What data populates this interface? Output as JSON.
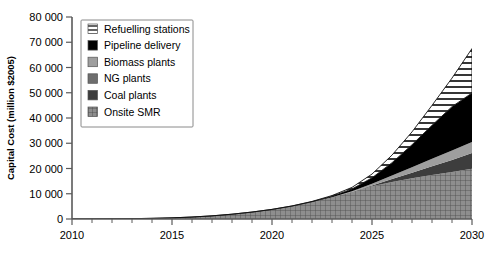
{
  "chart_data": {
    "type": "area",
    "stacked": true,
    "title": "",
    "xlabel": "",
    "ylabel": "Capital Cost (million $2005)",
    "xlim": [
      2010,
      2030
    ],
    "ylim": [
      0,
      80000
    ],
    "grid": false,
    "legend_position": "upper-left-inside",
    "xticks": [
      "2010",
      "2015",
      "2020",
      "2025",
      "2030"
    ],
    "xtick_values": [
      2010,
      2015,
      2020,
      2025,
      2030
    ],
    "xminor_step": 1,
    "yticks": [
      "0",
      "10 000",
      "20 000",
      "30 000",
      "40 000",
      "50 000",
      "60 000",
      "70 000",
      "80 000"
    ],
    "ytick_values": [
      0,
      10000,
      20000,
      30000,
      40000,
      50000,
      60000,
      70000,
      80000
    ],
    "x": [
      2010,
      2011,
      2012,
      2013,
      2014,
      2015,
      2016,
      2017,
      2018,
      2019,
      2020,
      2021,
      2022,
      2023,
      2024,
      2025,
      2026,
      2027,
      2028,
      2029,
      2030
    ],
    "series": [
      {
        "name": "Onsite SMR",
        "fill": "crosshatch-gray",
        "color": "#8c8c8c",
        "values": [
          0,
          20,
          60,
          130,
          260,
          450,
          780,
          1250,
          1900,
          2750,
          3800,
          5100,
          6700,
          8600,
          10800,
          13000,
          14700,
          16100,
          17400,
          18600,
          19900
        ]
      },
      {
        "name": "Coal plants",
        "fill": "solid-dark-gray",
        "color": "#3d3d3d",
        "values": [
          0,
          0,
          0,
          0,
          0,
          0,
          0,
          0,
          0,
          0,
          0,
          0,
          0,
          0,
          0,
          300,
          1100,
          2200,
          3500,
          4800,
          6200
        ]
      },
      {
        "name": "NG plants",
        "fill": "solid-mid-gray",
        "color": "#6e6e6e",
        "values": [
          0,
          0,
          0,
          0,
          0,
          0,
          0,
          0,
          0,
          0,
          0,
          0,
          0,
          0,
          0,
          0,
          0,
          0,
          0,
          0,
          0
        ]
      },
      {
        "name": "Biomass plants",
        "fill": "solid-light-gray",
        "color": "#9e9e9e",
        "values": [
          0,
          0,
          0,
          0,
          0,
          0,
          0,
          0,
          0,
          0,
          0,
          0,
          0,
          0,
          200,
          700,
          1400,
          2200,
          3000,
          3700,
          4400
        ]
      },
      {
        "name": "Pipeline delivery",
        "fill": "solid-black",
        "color": "#000000",
        "values": [
          0,
          0,
          0,
          0,
          0,
          0,
          0,
          0,
          0,
          0,
          0,
          40,
          150,
          400,
          900,
          2300,
          5100,
          8900,
          13200,
          17400,
          19400
        ]
      },
      {
        "name": "Refuelling stations",
        "fill": "horizontal-hatch",
        "color": "#ffffff",
        "values": [
          0,
          0,
          0,
          0,
          0,
          0,
          0,
          0,
          0,
          0,
          0,
          30,
          110,
          280,
          620,
          1500,
          3000,
          5100,
          7900,
          11300,
          17600
        ]
      }
    ],
    "totals": [
      0,
      20,
      60,
      130,
      260,
      450,
      780,
      1250,
      1900,
      2750,
      3800,
      5170,
      6960,
      9280,
      12520,
      17800,
      25300,
      34500,
      45000,
      55800,
      67500
    ],
    "legend_entries": [
      {
        "label": "Refuelling stations",
        "swatch": "horizontal-hatch"
      },
      {
        "label": "Pipeline delivery",
        "swatch": "solid-black"
      },
      {
        "label": "Biomass plants",
        "swatch": "solid-light-gray"
      },
      {
        "label": "NG plants",
        "swatch": "solid-mid-gray"
      },
      {
        "label": "Coal plants",
        "swatch": "solid-dark-gray"
      },
      {
        "label": "Onsite SMR",
        "swatch": "crosshatch-gray"
      }
    ]
  },
  "colors": {
    "axis": "#5a5a5a",
    "text": "#000000",
    "background": "#ffffff",
    "legend_border": "#8a8a8a"
  }
}
